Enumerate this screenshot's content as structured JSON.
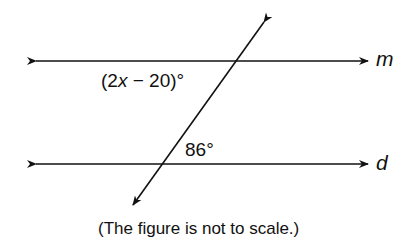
{
  "diagram": {
    "lines": [
      {
        "name": "m",
        "label": "m",
        "type": "parallel"
      },
      {
        "name": "d",
        "label": "d",
        "type": "parallel"
      },
      {
        "name": "transversal",
        "label": "",
        "type": "transversal"
      }
    ],
    "angles": {
      "upper": {
        "prefix": "(2",
        "variable": "x",
        "suffix": " − 20)°"
      },
      "lower": {
        "text": "86°"
      }
    },
    "caption": "(The figure is not to scale.)",
    "colors": {
      "stroke": "#111111",
      "background": "#ffffff"
    }
  }
}
